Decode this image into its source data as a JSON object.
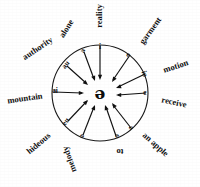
{
  "figure": {
    "type": "radial-diagram",
    "center_symbol": "ə",
    "center_symbol_name": "schwa",
    "circle": {
      "cx": 100,
      "cy": 93,
      "r": 48
    },
    "spoke_count": 10,
    "arrow_direction": "inward",
    "spokes": [
      {
        "id": "spoke-i-reality",
        "vowel": "i",
        "word": "reality",
        "angle_deg": -90,
        "vowel_x": 100,
        "vowel_y": 47,
        "vowel_rotate": 0,
        "word_x": 100,
        "word_y": 16,
        "word_rotate": -90,
        "line_x1": 100,
        "line_y1": 46,
        "line_x2": 100,
        "line_y2": 78,
        "arrow_x": 100,
        "arrow_y": 80,
        "arrow_rotate": 90
      },
      {
        "id": "spoke-e-garment",
        "vowel": "e",
        "word": "garment",
        "angle_deg": -54,
        "vowel_x": 128,
        "vowel_y": 55,
        "vowel_rotate": 36,
        "word_x": 151,
        "word_y": 31,
        "word_rotate": -54,
        "line_x1": 130,
        "line_y1": 55,
        "line_x2": 113,
        "line_y2": 80,
        "arrow_x": 112,
        "arrow_y": 82,
        "arrow_rotate": 124
      },
      {
        "id": "spoke-io-motion",
        "vowel": "io",
        "word": "motion",
        "angle_deg": -18,
        "vowel_x": 144,
        "vowel_y": 74,
        "vowel_rotate": 72,
        "word_x": 176,
        "word_y": 67,
        "word_rotate": -18,
        "line_x1": 145,
        "line_y1": 74,
        "line_x2": 118,
        "line_y2": 87,
        "arrow_x": 116,
        "arrow_y": 88,
        "arrow_rotate": 160
      },
      {
        "id": "spoke-e-receive",
        "vowel": "e",
        "word": "receive",
        "angle_deg": 18,
        "vowel_x": 145,
        "vowel_y": 93,
        "vowel_rotate": 0,
        "word_x": 174,
        "word_y": 103,
        "word_rotate": 12,
        "line_x1": 146,
        "line_y1": 93,
        "line_x2": 118,
        "line_y2": 95,
        "arrow_x": 116,
        "arrow_y": 95,
        "arrow_rotate": 180
      },
      {
        "id": "spoke-a-an-apple",
        "vowel": "a",
        "word": "an apple",
        "angle_deg": 54,
        "vowel_x": 131,
        "vowel_y": 128,
        "vowel_rotate": 52,
        "word_x": 155,
        "word_y": 145,
        "word_rotate": 42,
        "line_x1": 131,
        "line_y1": 128,
        "line_x2": 113,
        "line_y2": 105,
        "arrow_x": 112,
        "arrow_y": 103,
        "arrow_rotate": -127
      },
      {
        "id": "spoke-o-to",
        "vowel": "o",
        "word": "to",
        "angle_deg": 72,
        "vowel_x": 117,
        "vowel_y": 136,
        "vowel_rotate": 108,
        "word_x": 120,
        "word_y": 151,
        "word_rotate": 180,
        "line_x1": 116,
        "line_y1": 136,
        "line_x2": 106,
        "line_y2": 107,
        "arrow_x": 105,
        "arrow_y": 105,
        "arrow_rotate": -109
      },
      {
        "id": "spoke-o-melody",
        "vowel": "o",
        "word": "melody",
        "angle_deg": 108,
        "vowel_x": 82,
        "vowel_y": 136,
        "vowel_rotate": -108,
        "word_x": 70,
        "word_y": 159,
        "word_rotate": -110,
        "line_x1": 83,
        "line_y1": 135,
        "line_x2": 94,
        "line_y2": 107,
        "arrow_x": 95,
        "arrow_y": 105,
        "arrow_rotate": -69
      },
      {
        "id": "spoke-eu-hideous",
        "vowel": "eu",
        "word": "hideous",
        "angle_deg": 144,
        "vowel_x": 66,
        "vowel_y": 122,
        "vowel_rotate": -55,
        "word_x": 39,
        "word_y": 144,
        "word_rotate": -40,
        "line_x1": 68,
        "line_y1": 121,
        "line_x2": 87,
        "line_y2": 101,
        "arrow_x": 88,
        "arrow_y": 100,
        "arrow_rotate": -47
      },
      {
        "id": "spoke-ai-mountain",
        "vowel": "ai",
        "word": "mountain",
        "angle_deg": 180,
        "vowel_x": 55,
        "vowel_y": 91,
        "vowel_rotate": 0,
        "word_x": 25,
        "word_y": 99,
        "word_rotate": -8,
        "line_x1": 54,
        "line_y1": 92,
        "line_x2": 82,
        "line_y2": 93,
        "arrow_x": 84,
        "arrow_y": 93,
        "arrow_rotate": 0
      },
      {
        "id": "spoke-au-authority",
        "vowel": "au",
        "word": "authority",
        "angle_deg": -144,
        "vowel_x": 66,
        "vowel_y": 65,
        "vowel_rotate": -52,
        "word_x": 38,
        "word_y": 49,
        "word_rotate": -34,
        "line_x1": 67,
        "line_y1": 66,
        "line_x2": 86,
        "line_y2": 83,
        "arrow_x": 88,
        "arrow_y": 85,
        "arrow_rotate": 41
      },
      {
        "id": "spoke-a-alone",
        "vowel": "a",
        "word": "alone",
        "angle_deg": -108,
        "vowel_x": 83,
        "vowel_y": 51,
        "vowel_rotate": -70,
        "word_x": 67,
        "word_y": 29,
        "word_rotate": -58,
        "line_x1": 84,
        "line_y1": 52,
        "line_x2": 94,
        "line_y2": 79,
        "arrow_x": 95,
        "arrow_y": 81,
        "arrow_rotate": 70
      }
    ]
  }
}
